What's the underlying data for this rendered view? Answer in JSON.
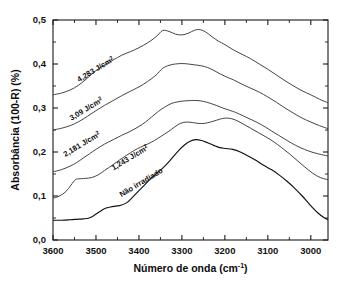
{
  "chart_data": {
    "type": "line",
    "title": "",
    "xlabel": "Número de onda (cm-1)",
    "xlabel_base": "Número de onda (cm",
    "xlabel_sup": "-1",
    "xlabel_tail": ")",
    "ylabel": "Absorbância (100-R)  (%)",
    "xlim": [
      3600,
      2960
    ],
    "ylim": [
      0.0,
      0.5
    ],
    "xticks": [
      3600,
      3500,
      3400,
      3300,
      3200,
      3100,
      3000
    ],
    "xticklabels": [
      "3600",
      "3500",
      "3400",
      "3300",
      "3200",
      "3100",
      "3000"
    ],
    "yticks": [
      0.0,
      0.1,
      0.2,
      0.3,
      0.4,
      0.5
    ],
    "yticklabels": [
      "0,0",
      "0,1",
      "0,2",
      "0,3",
      "0,4",
      "0,5"
    ],
    "x_minor_step": 50,
    "y_minor_step": 0.05,
    "x_axis_inverted": true,
    "grid": false,
    "legend_position": "inline-annotations",
    "line_color": "#3a3a3a",
    "series": [
      {
        "name": "4,283 J/cm2",
        "label_text": "4,283 J/cm",
        "label_sup": "2",
        "label_x": 3498,
        "label_y": 0.383,
        "label_angle": -31,
        "x": [
          3600,
          3580,
          3560,
          3540,
          3520,
          3500,
          3480,
          3460,
          3440,
          3420,
          3400,
          3380,
          3360,
          3345,
          3330,
          3315,
          3300,
          3285,
          3270,
          3258,
          3245,
          3230,
          3215,
          3200,
          3180,
          3160,
          3140,
          3120,
          3100,
          3080,
          3060,
          3040,
          3020,
          3000,
          2980,
          2960
        ],
        "y": [
          0.33,
          0.334,
          0.341,
          0.352,
          0.368,
          0.385,
          0.398,
          0.409,
          0.42,
          0.428,
          0.437,
          0.448,
          0.462,
          0.476,
          0.474,
          0.468,
          0.466,
          0.47,
          0.477,
          0.478,
          0.473,
          0.462,
          0.452,
          0.444,
          0.432,
          0.422,
          0.412,
          0.4,
          0.388,
          0.375,
          0.362,
          0.35,
          0.339,
          0.33,
          0.32,
          0.312
        ]
      },
      {
        "name": "3,09 J/cm2",
        "label_text": "3,09 J/cm",
        "label_sup": "2",
        "label_x": 3520,
        "label_y": 0.293,
        "label_angle": -31,
        "x": [
          3600,
          3580,
          3560,
          3540,
          3520,
          3500,
          3480,
          3460,
          3440,
          3420,
          3400,
          3380,
          3360,
          3345,
          3330,
          3315,
          3300,
          3285,
          3270,
          3255,
          3240,
          3225,
          3210,
          3195,
          3180,
          3160,
          3140,
          3120,
          3100,
          3080,
          3060,
          3040,
          3020,
          3000,
          2980,
          2960
        ],
        "y": [
          0.25,
          0.254,
          0.26,
          0.269,
          0.281,
          0.294,
          0.306,
          0.317,
          0.328,
          0.338,
          0.348,
          0.36,
          0.375,
          0.39,
          0.397,
          0.4,
          0.401,
          0.4,
          0.398,
          0.396,
          0.392,
          0.385,
          0.377,
          0.37,
          0.364,
          0.354,
          0.345,
          0.336,
          0.325,
          0.313,
          0.3,
          0.288,
          0.277,
          0.268,
          0.26,
          0.253
        ]
      },
      {
        "name": "2,181 J/cm2",
        "label_text": "2,181 J/cm",
        "label_sup": "2",
        "label_x": 3530,
        "label_y": 0.213,
        "label_angle": -31,
        "x": [
          3600,
          3580,
          3560,
          3545,
          3530,
          3515,
          3500,
          3480,
          3460,
          3440,
          3420,
          3400,
          3385,
          3370,
          3355,
          3340,
          3325,
          3310,
          3295,
          3280,
          3265,
          3250,
          3235,
          3220,
          3205,
          3190,
          3175,
          3155,
          3135,
          3115,
          3095,
          3075,
          3055,
          3035,
          3015,
          2995,
          2975,
          2960
        ],
        "y": [
          0.155,
          0.16,
          0.168,
          0.176,
          0.186,
          0.196,
          0.206,
          0.218,
          0.228,
          0.238,
          0.247,
          0.258,
          0.268,
          0.28,
          0.292,
          0.302,
          0.31,
          0.314,
          0.316,
          0.317,
          0.317,
          0.315,
          0.311,
          0.306,
          0.3,
          0.295,
          0.29,
          0.281,
          0.272,
          0.262,
          0.25,
          0.238,
          0.226,
          0.215,
          0.206,
          0.199,
          0.194,
          0.191
        ]
      },
      {
        "name": "1,243 J/cm2",
        "label_text": "1,243 J/cm",
        "label_sup": "2",
        "label_x": 3418,
        "label_y": 0.182,
        "label_angle": -31,
        "x": [
          3600,
          3585,
          3570,
          3558,
          3548,
          3540,
          3525,
          3510,
          3495,
          3480,
          3462,
          3445,
          3428,
          3412,
          3396,
          3380,
          3364,
          3348,
          3332,
          3318,
          3304,
          3290,
          3276,
          3262,
          3248,
          3234,
          3220,
          3206,
          3192,
          3176,
          3158,
          3140,
          3122,
          3104,
          3086,
          3068,
          3050,
          3032,
          3014,
          2996,
          2978,
          2960
        ],
        "y": [
          0.095,
          0.1,
          0.11,
          0.125,
          0.137,
          0.139,
          0.14,
          0.142,
          0.148,
          0.158,
          0.17,
          0.182,
          0.193,
          0.203,
          0.211,
          0.218,
          0.226,
          0.236,
          0.246,
          0.256,
          0.265,
          0.268,
          0.267,
          0.265,
          0.265,
          0.268,
          0.272,
          0.276,
          0.277,
          0.273,
          0.264,
          0.254,
          0.244,
          0.234,
          0.223,
          0.21,
          0.196,
          0.181,
          0.166,
          0.152,
          0.142,
          0.137
        ]
      },
      {
        "name": "Não irradiado",
        "label_text": "Não irradiado",
        "label_sup": "",
        "label_x": 3392,
        "label_y": 0.126,
        "label_angle": -31,
        "x": [
          3600,
          3580,
          3560,
          3545,
          3530,
          3516,
          3504,
          3492,
          3478,
          3466,
          3454,
          3442,
          3428,
          3414,
          3400,
          3386,
          3372,
          3358,
          3344,
          3330,
          3318,
          3306,
          3294,
          3282,
          3268,
          3254,
          3240,
          3226,
          3212,
          3198,
          3182,
          3164,
          3146,
          3128,
          3110,
          3092,
          3074,
          3056,
          3038,
          3020,
          3002,
          2984,
          2968,
          2960
        ],
        "y": [
          0.045,
          0.045,
          0.046,
          0.047,
          0.048,
          0.05,
          0.056,
          0.064,
          0.072,
          0.075,
          0.077,
          0.079,
          0.085,
          0.098,
          0.112,
          0.126,
          0.14,
          0.152,
          0.164,
          0.178,
          0.192,
          0.205,
          0.216,
          0.224,
          0.228,
          0.226,
          0.221,
          0.215,
          0.21,
          0.208,
          0.206,
          0.2,
          0.191,
          0.181,
          0.17,
          0.16,
          0.148,
          0.134,
          0.118,
          0.1,
          0.08,
          0.062,
          0.05,
          0.046
        ]
      }
    ]
  }
}
